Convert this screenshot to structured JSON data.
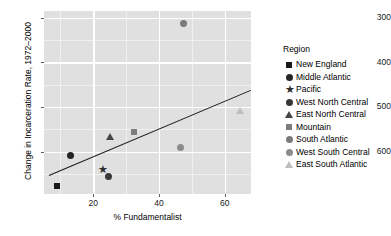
{
  "chart_data": {
    "type": "scatter",
    "title": "",
    "xlabel": "% Fundamentalist",
    "ylabel": "Change in Incarceration Rate, 1972–2000",
    "xlim": [
      5,
      68
    ],
    "ylim": [
      205,
      615
    ],
    "xticks": [
      20,
      40,
      60
    ],
    "yticks": [
      300,
      400,
      500,
      600
    ],
    "grid": true,
    "legend_position": "right",
    "legend_title": "Region",
    "series": [
      {
        "name": "New England",
        "marker": "square",
        "color": "#1a1a1a",
        "points": [
          {
            "x": 9,
            "y": 222
          }
        ]
      },
      {
        "name": "Middle Atlantic",
        "marker": "circle",
        "color": "#242424",
        "points": [
          {
            "x": 13,
            "y": 291
          }
        ]
      },
      {
        "name": "Pacific",
        "marker": "star",
        "color": "#2e2e2e",
        "points": [
          {
            "x": 22.5,
            "y": 258
          }
        ]
      },
      {
        "name": "West North Central",
        "marker": "circle",
        "color": "#383838",
        "points": [
          {
            "x": 24.5,
            "y": 245
          }
        ]
      },
      {
        "name": "East North Central",
        "marker": "triangle",
        "color": "#454545",
        "points": [
          {
            "x": 25,
            "y": 332
          }
        ]
      },
      {
        "name": "Mountain",
        "marker": "square",
        "color": "#7d7d7d",
        "points": [
          {
            "x": 32.5,
            "y": 343
          }
        ]
      },
      {
        "name": "South Atlantic",
        "marker": "circle",
        "color": "#7a7a7a",
        "points": [
          {
            "x": 47.5,
            "y": 586
          }
        ]
      },
      {
        "name": "West South Central",
        "marker": "circle",
        "color": "#8c8c8c",
        "points": [
          {
            "x": 46.5,
            "y": 310
          }
        ]
      },
      {
        "name": "East South Atlantic",
        "marker": "triangle",
        "color": "#bdbdbd",
        "points": [
          {
            "x": 64.5,
            "y": 392
          }
        ]
      }
    ],
    "trendline": {
      "label": "linear fit",
      "x1": 6.5,
      "y1": 247,
      "x2": 68,
      "y2": 438,
      "color": "#1a1a1a"
    }
  },
  "axes": {
    "y_title": "Change in Incarceration Rate, 1972–2000",
    "x_title": "% Fundamentalist",
    "y_tick_labels": [
      "600",
      "500",
      "400",
      "300"
    ],
    "x_tick_labels": [
      "20",
      "40",
      "60"
    ]
  },
  "legend": {
    "title": "Region",
    "items": [
      {
        "label": "New England",
        "icon": "square-marker-icon"
      },
      {
        "label": "Middle Atlantic",
        "icon": "circle-marker-icon"
      },
      {
        "label": "Pacific",
        "icon": "star-marker-icon"
      },
      {
        "label": "West North Central",
        "icon": "circle-marker-icon"
      },
      {
        "label": "East North Central",
        "icon": "triangle-marker-icon"
      },
      {
        "label": "Mountain",
        "icon": "square-marker-icon"
      },
      {
        "label": "South Atlantic",
        "icon": "circle-marker-icon"
      },
      {
        "label": "West South Central",
        "icon": "circle-marker-icon"
      },
      {
        "label": "East South Atlantic",
        "icon": "triangle-marker-icon"
      }
    ]
  },
  "colors": {
    "panel_background": "#e0e0e0",
    "gridline": "#ffffff",
    "figure_background": "#ffffff",
    "trendline": "#1a1a1a"
  },
  "star_glyph": "★"
}
